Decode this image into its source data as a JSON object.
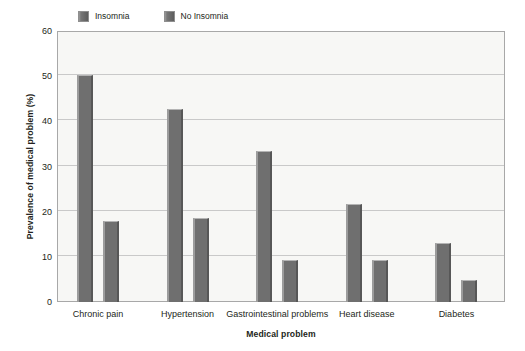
{
  "chart_data": {
    "type": "bar",
    "title": "",
    "subtitle": "",
    "xlabel": "Medical problem",
    "ylabel": "Prevalence of medical problem (%)",
    "categories": [
      "Chronic pain",
      "Hypertension",
      "Gastrointestinal problems",
      "Heart disease",
      "Diabetes"
    ],
    "series": [
      {
        "name": "Insomnia",
        "values": [
          50.2,
          42.7,
          33.5,
          21.7,
          13.0
        ]
      },
      {
        "name": "No Insomnia",
        "values": [
          17.9,
          18.5,
          9.2,
          9.4,
          4.8
        ]
      }
    ],
    "ylim": [
      0,
      60
    ],
    "ytick_labels": [
      "60",
      "50",
      "40",
      "30",
      "20",
      "10",
      "0"
    ],
    "ytick_values": [
      60,
      50,
      40,
      30,
      20,
      10,
      0
    ],
    "grid": true,
    "grid_axis": "y",
    "legend_position": "top-left",
    "bar_color": "#6f6f6f",
    "plot_background": "#f7f7f5",
    "grid_color": "#c9c9c9",
    "axis_color": "#a8a8a8"
  },
  "legend": {
    "items": [
      {
        "label": "Insomnia",
        "color": "#6f6f6f"
      },
      {
        "label": "No Insomnia",
        "color": "#6f6f6f"
      }
    ]
  }
}
